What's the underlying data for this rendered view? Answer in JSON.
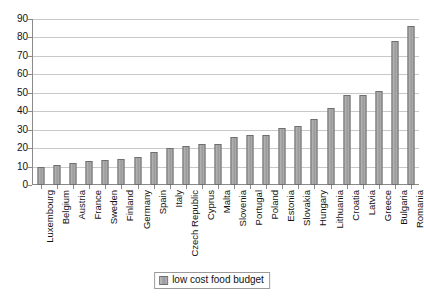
{
  "chart_data": {
    "type": "bar",
    "title": "",
    "xlabel": "",
    "ylabel": "",
    "ylim": [
      0,
      90
    ],
    "yticks": [
      0,
      10,
      20,
      30,
      40,
      50,
      60,
      70,
      80,
      90
    ],
    "grid": true,
    "legend_position": "bottom-center",
    "legend_entries": [
      "low cost food budget"
    ],
    "bar_color": "#a8a8a8",
    "bar_border_color": "#6f6f6f",
    "categories": [
      "Luxembourg",
      "Belgium",
      "Austria",
      "France",
      "Sweden",
      "Finland",
      "Germany",
      "Spain",
      "Italy",
      "Czech Republic",
      "Cyprus",
      "Malta",
      "Slovenia",
      "Portugal",
      "Poland",
      "Estonia",
      "Slovakia",
      "Hungary",
      "Lithuania",
      "Croatia",
      "Latvia",
      "Greece",
      "Bulgaria",
      "Romania"
    ],
    "series": [
      {
        "name": "low cost food budget",
        "values": [
          9.5,
          11,
          12,
          13,
          13.5,
          14,
          15,
          18,
          20,
          21,
          22,
          22.5,
          26,
          27,
          27,
          31,
          32,
          36,
          42,
          49,
          49,
          51,
          78,
          86
        ]
      }
    ]
  },
  "legend": {
    "label": "low cost food budget"
  }
}
